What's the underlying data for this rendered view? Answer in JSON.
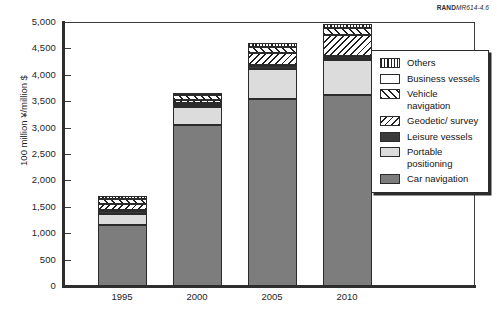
{
  "credit": {
    "prefix": "RAND",
    "suffix": "MR614-4.6"
  },
  "chart_data": {
    "type": "bar",
    "stacked": true,
    "title": "",
    "xlabel": "",
    "ylabel": "100 million ¥/million $",
    "ylim": [
      0,
      5000
    ],
    "yticks": [
      "0",
      "500",
      "1,000",
      "1,500",
      "2,000",
      "2,500",
      "3,000",
      "3,500",
      "4,000",
      "4,500",
      "5,000"
    ],
    "ytick_values": [
      0,
      500,
      1000,
      1500,
      2000,
      2500,
      3000,
      3500,
      4000,
      4500,
      5000
    ],
    "grid": false,
    "legend_position": "right-inside",
    "categories": [
      "1995",
      "2000",
      "2005",
      "2010"
    ],
    "series": [
      {
        "name": "Car navigation",
        "key": "car",
        "values": [
          1150,
          3050,
          3550,
          3620
        ]
      },
      {
        "name": "Portable positioning",
        "key": "portable",
        "values": [
          220,
          340,
          560,
          660
        ]
      },
      {
        "name": "Leisure vessels",
        "key": "leisure",
        "values": [
          30,
          30,
          30,
          30
        ]
      },
      {
        "name": "Business vessels",
        "key": "business",
        "values": [
          40,
          50,
          50,
          50
        ]
      },
      {
        "name": "Geodetic/survey",
        "key": "geodetic",
        "values": [
          110,
          50,
          230,
          400
        ]
      },
      {
        "name": "Vehicle navigation",
        "key": "vehicle",
        "values": [
          90,
          90,
          110,
          120
        ]
      },
      {
        "name": "Others",
        "key": "others",
        "values": [
          60,
          40,
          70,
          80
        ]
      }
    ],
    "totals": [
      1700,
      3650,
      4600,
      4960
    ]
  },
  "legend": {
    "items": [
      {
        "label": "Others",
        "key": "others"
      },
      {
        "label": "Business vessels",
        "key": "business"
      },
      {
        "label": "Vehicle navigation",
        "key": "vehicle"
      },
      {
        "label": "Geodetic/ survey",
        "key": "geodetic"
      },
      {
        "label": "Leisure vessels",
        "key": "leisure"
      },
      {
        "label": "Portable positioning",
        "key": "portable"
      },
      {
        "label": "Car navigation",
        "key": "car"
      }
    ]
  }
}
